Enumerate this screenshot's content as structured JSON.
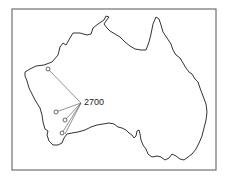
{
  "map": {
    "region": "Australia",
    "label": "2700",
    "label_position": {
      "x": 83,
      "y": 98
    },
    "hub_point": {
      "x": 81,
      "y": 103
    },
    "sites": [
      {
        "x": 48,
        "y": 69
      },
      {
        "x": 56,
        "y": 112
      },
      {
        "x": 65,
        "y": 120
      },
      {
        "x": 62,
        "y": 133
      }
    ],
    "colors": {
      "outline": "#333333",
      "lines": "#666666",
      "frame": "#555555"
    }
  }
}
